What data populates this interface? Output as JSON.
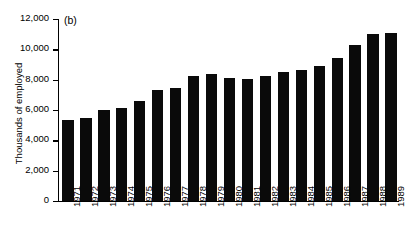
{
  "figure": {
    "panel_label": "(b)"
  },
  "chart_data": {
    "type": "bar",
    "title": "",
    "subtitle": "",
    "panel": "(b)",
    "xlabel": "",
    "ylabel": "Thousands of employed",
    "categories": [
      "1971",
      "1972",
      "1973",
      "1974",
      "1975",
      "1976",
      "1977",
      "1978",
      "1979",
      "1980",
      "1981",
      "1982",
      "1983",
      "1984",
      "1985",
      "1986",
      "1987",
      "1988",
      "1989"
    ],
    "values": [
      5350,
      5450,
      6000,
      6150,
      6600,
      7350,
      7450,
      8250,
      8350,
      8100,
      8050,
      8250,
      8500,
      8650,
      8900,
      9450,
      10300,
      11000,
      11100
    ],
    "ylim": [
      0,
      12000
    ],
    "ytick_values": [
      0,
      2000,
      4000,
      6000,
      8000,
      10000,
      12000
    ],
    "ytick_labels": [
      "0",
      "2,000",
      "4,000",
      "6,000",
      "8,000",
      "10,000",
      "12,000"
    ],
    "grid": false,
    "legend": null,
    "bar_color": "#0a0a0a",
    "axis_color": "#000000",
    "background": "#ffffff"
  }
}
